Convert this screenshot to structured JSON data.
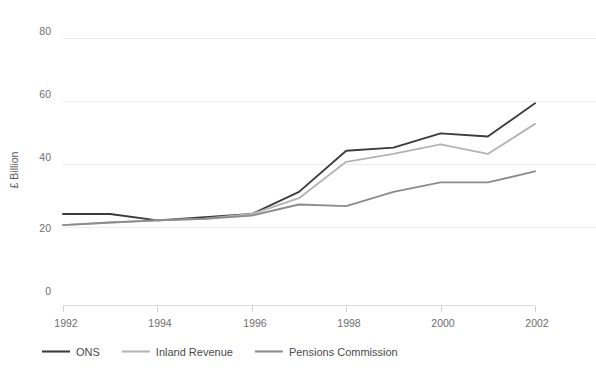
{
  "chart_data": {
    "type": "line",
    "title": "",
    "subtitle": "",
    "xlabel": "",
    "ylabel": "£ Billion",
    "x": [
      1992,
      1993,
      1994,
      1995,
      1996,
      1997,
      1998,
      1999,
      2000,
      2001,
      2002
    ],
    "xticks": [
      "1992",
      "1994",
      "1996",
      "1998",
      "2000",
      "2002"
    ],
    "xtick_values": [
      1992,
      1994,
      1996,
      1998,
      2000,
      2002
    ],
    "yticks": [
      "0",
      "20",
      "40",
      "60",
      "80"
    ],
    "ytick_values": [
      0,
      20,
      40,
      60,
      80
    ],
    "xlim": [
      1992,
      2002
    ],
    "ylim": [
      0,
      84
    ],
    "grid": true,
    "legend_position": "bottom",
    "series": [
      {
        "name": "ONS",
        "color": "#3c3c3c",
        "values": [
          24.5,
          24.5,
          22.5,
          23.5,
          24.5,
          31.5,
          44.5,
          45.5,
          50.0,
          49.0,
          59.5
        ]
      },
      {
        "name": "Inland Revenue",
        "color": "#b4b4b4",
        "values": [
          21.0,
          21.8,
          22.5,
          23.0,
          24.5,
          29.5,
          41.0,
          43.5,
          46.5,
          43.5,
          53.0
        ]
      },
      {
        "name": "Pensions Commission",
        "color": "#8c8c8c",
        "values": [
          21.0,
          21.8,
          22.5,
          23.0,
          24.0,
          27.5,
          27.0,
          31.5,
          34.5,
          34.5,
          38.0
        ]
      }
    ]
  },
  "legend": {
    "items": [
      {
        "label": "ONS",
        "color": "#3c3c3c"
      },
      {
        "label": "Inland Revenue",
        "color": "#b4b4b4"
      },
      {
        "label": "Pensions Commission",
        "color": "#8c8c8c"
      }
    ]
  },
  "axes": {
    "y_title": "£ Billion",
    "y_tick_labels": [
      "80",
      "60",
      "40",
      "20",
      "0"
    ],
    "x_tick_labels": [
      "1992",
      "1994",
      "1996",
      "1998",
      "2000",
      "2002"
    ]
  }
}
